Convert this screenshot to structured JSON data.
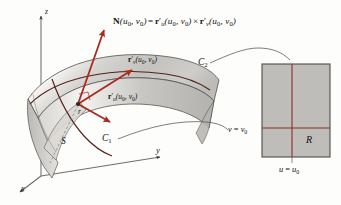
{
  "figure": {
    "background_color": "#fdfdfc"
  },
  "colors": {
    "vector_red": "#a82b1e",
    "curve_dark": "#5a1f16",
    "axis_gray": "#6e6e6e",
    "surface_light": "#f2f1ef",
    "surface_mid": "#c9c7c3",
    "surface_dark": "#aaa8a4",
    "region_fill": "#bfbdb9",
    "region_border": "#5a5853",
    "grid_line": "#8c2f22",
    "text": "#14120f"
  },
  "equation": {
    "normal_lhs_symbol": "N",
    "normal_lhs_args": "(u0, v0)",
    "equals": "=",
    "term1_symbol": "r",
    "term1_sub": "u",
    "term1_args": "(u0, v0)",
    "cross": "×",
    "term2_symbol": "r",
    "term2_sub": "v",
    "term2_args": "(u0, v0)",
    "full_text": "N(u0, v0) = r'u(u0, v0) × r'v(u0, v0)"
  },
  "vectors": [
    {
      "id": "normal",
      "name": "N",
      "label": "N(u0, v0)",
      "description": "surface normal vector pointing up-left",
      "color": "#a82b1e"
    },
    {
      "id": "tangent-v",
      "name": "r'v",
      "label": "r'v(u0, v0)",
      "description": "tangent vector along the v parameter direction",
      "color": "#a82b1e",
      "label_symbol": "r",
      "label_sub": "v",
      "label_args": "(u0, v0)"
    },
    {
      "id": "tangent-u",
      "name": "r'u",
      "label": "r'u(u0, v0)",
      "description": "tangent vector along the u parameter direction",
      "color": "#a82b1e",
      "label_symbol": "r",
      "label_sub": "u",
      "label_args": "(u0, v0)"
    }
  ],
  "surface": {
    "label": "S",
    "point_label": "r",
    "curves": [
      {
        "label": "C",
        "subscript": "1",
        "description": "grid curve running down the surface"
      },
      {
        "label": "C",
        "subscript": "2",
        "description": "grid curve running along the top of the surface"
      }
    ]
  },
  "axes": {
    "z": "z",
    "y": "y",
    "x": "x"
  },
  "parameter_region": {
    "label": "R",
    "v_line_label_lhs": "v",
    "v_line_label_eq": "=",
    "v_line_label_rhs": "v",
    "v_line_label_sub": "0",
    "v_line_full": "v = v0",
    "u_line_lhs": "u",
    "u_line_eq": "=",
    "u_line_rhs": "u",
    "u_line_sub": "0",
    "u_line_full": "u = u0"
  }
}
